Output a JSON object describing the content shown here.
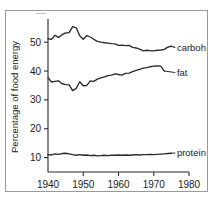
{
  "figure": {
    "background_color": "#ffffff",
    "frame_color": "#9a9a9a",
    "ink_color": "#2b2b2b"
  },
  "chart_data": {
    "type": "line",
    "title": "",
    "subtitle": "",
    "xlabel": "",
    "ylabel": "Percentage of food energy",
    "xlim": [
      1940,
      1980
    ],
    "ylim": [
      5,
      57
    ],
    "grid": false,
    "legend_position": "right-inline-labels",
    "x_ticks": [
      1940,
      1950,
      1960,
      1970,
      1980
    ],
    "x_tick_labels": [
      "1940",
      "1950",
      "1960",
      "1970",
      "1980"
    ],
    "y_ticks": [
      10,
      20,
      30,
      40,
      50
    ],
    "y_tick_labels": [
      "10",
      "20",
      "30",
      "40",
      "50"
    ],
    "annotations": [
      {
        "text": "carboh",
        "series": "carboh",
        "x": 1976,
        "y": 48.2
      },
      {
        "text": "fat",
        "series": "fat",
        "x": 1976,
        "y": 39.5
      },
      {
        "text": "protein",
        "series": "protein",
        "x": 1976,
        "y": 11.6
      }
    ],
    "series": [
      {
        "name": "carboh",
        "label": "carboh",
        "x": [
          1940,
          1941,
          1942,
          1943,
          1944,
          1945,
          1946,
          1947,
          1948,
          1949,
          1950,
          1951,
          1952,
          1953,
          1954,
          1955,
          1956,
          1957,
          1958,
          1959,
          1960,
          1961,
          1962,
          1963,
          1964,
          1965,
          1966,
          1967,
          1968,
          1969,
          1970,
          1971,
          1972,
          1973,
          1974,
          1975
        ],
        "values": [
          51.2,
          51.0,
          52.4,
          51.6,
          52.6,
          53.2,
          53.3,
          55.4,
          55.0,
          52.2,
          51.0,
          52.3,
          51.8,
          51.0,
          50.3,
          50.0,
          49.8,
          49.7,
          49.5,
          49.4,
          48.9,
          49.0,
          48.8,
          48.9,
          48.2,
          48.0,
          47.6,
          47.0,
          47.2,
          47.1,
          47.0,
          47.2,
          47.3,
          47.5,
          48.3,
          48.6
        ]
      },
      {
        "name": "fat",
        "label": "fat",
        "x": [
          1940,
          1941,
          1942,
          1943,
          1944,
          1945,
          1946,
          1947,
          1948,
          1949,
          1950,
          1951,
          1952,
          1953,
          1954,
          1955,
          1956,
          1957,
          1958,
          1959,
          1960,
          1961,
          1962,
          1963,
          1964,
          1965,
          1966,
          1967,
          1968,
          1969,
          1970,
          1971,
          1972,
          1973
        ],
        "values": [
          37.7,
          36.2,
          36.4,
          36.6,
          35.6,
          35.3,
          35.2,
          33.2,
          34.0,
          36.3,
          34.9,
          35.0,
          36.6,
          36.4,
          37.2,
          37.6,
          38.0,
          38.4,
          38.6,
          39.0,
          38.8,
          38.6,
          39.2,
          39.3,
          39.8,
          40.2,
          40.6,
          41.0,
          41.2,
          41.5,
          41.7,
          41.8,
          41.7,
          40.0
        ]
      },
      {
        "name": "protein",
        "label": "protein",
        "x": [
          1940,
          1941,
          1942,
          1943,
          1944,
          1945,
          1946,
          1947,
          1948,
          1949,
          1950,
          1951,
          1952,
          1953,
          1954,
          1955,
          1956,
          1957,
          1958,
          1959,
          1960,
          1961,
          1962,
          1963,
          1964,
          1965,
          1966,
          1967,
          1968,
          1969,
          1970,
          1971,
          1972,
          1973,
          1974,
          1975
        ],
        "values": [
          11.0,
          10.9,
          11.3,
          11.1,
          11.4,
          11.5,
          11.3,
          11.0,
          10.8,
          11.0,
          10.8,
          10.9,
          10.7,
          10.8,
          10.6,
          10.7,
          10.8,
          10.7,
          10.8,
          10.8,
          10.9,
          10.8,
          10.9,
          10.8,
          10.9,
          11.0,
          10.9,
          11.0,
          11.0,
          11.1,
          11.0,
          11.1,
          11.2,
          11.3,
          11.4,
          11.5
        ]
      }
    ]
  }
}
